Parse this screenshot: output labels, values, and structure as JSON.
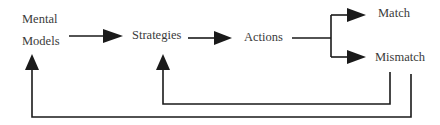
{
  "diagram": {
    "type": "flow-feedback-loop",
    "colors": {
      "line": "#1a1a1a",
      "text": "#3a3a3a",
      "background": "#ffffff"
    },
    "nodes": {
      "mental_models": {
        "line1": "Mental",
        "line2": "Models"
      },
      "strategies": {
        "label": "Strategies"
      },
      "actions": {
        "label": "Actions"
      },
      "match": {
        "label": "Match"
      },
      "mismatch": {
        "label": "Mismatch"
      }
    },
    "edges": [
      {
        "from": "Mental Models",
        "to": "Strategies"
      },
      {
        "from": "Strategies",
        "to": "Actions"
      },
      {
        "from": "Actions",
        "to": "Match"
      },
      {
        "from": "Actions",
        "to": "Mismatch"
      },
      {
        "from": "Mismatch",
        "to": "Strategies",
        "kind": "feedback-inner"
      },
      {
        "from": "Mismatch",
        "to": "Mental Models",
        "kind": "feedback-outer"
      }
    ]
  }
}
